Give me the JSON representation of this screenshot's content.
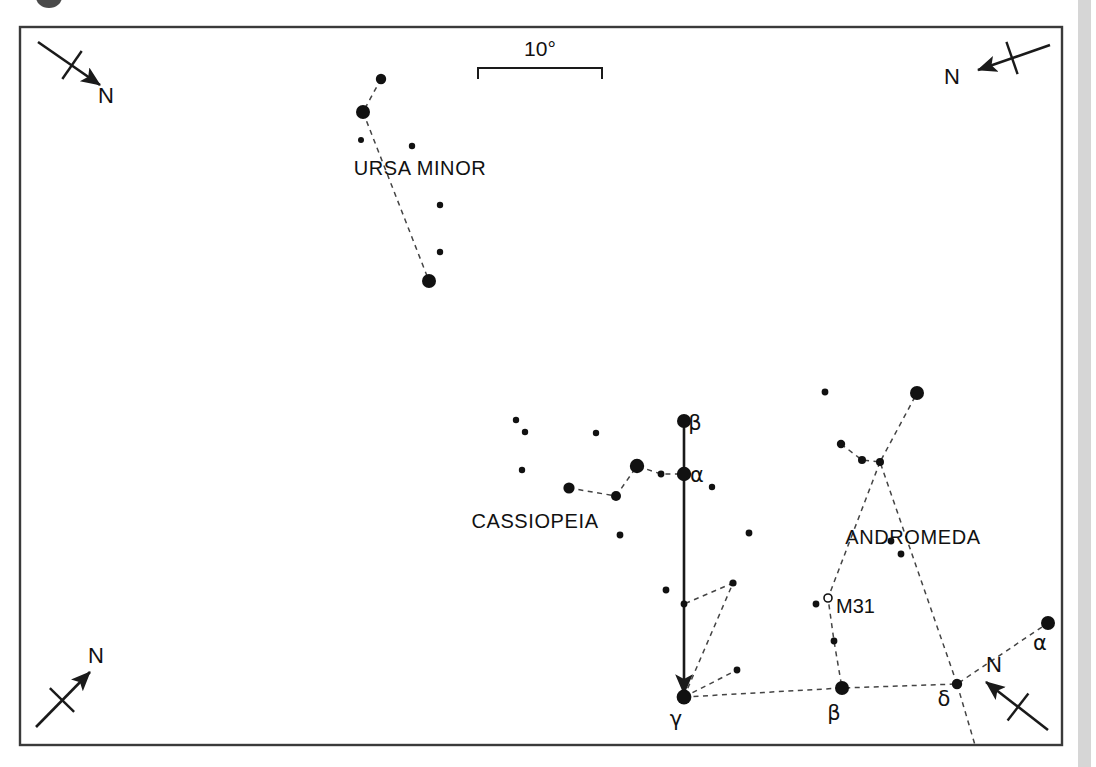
{
  "figure": {
    "kind": "star-chart",
    "frame": {
      "x": 20,
      "y": 27,
      "width": 1042,
      "height": 718
    }
  },
  "scale_bar": {
    "label": "10°",
    "x1": 478,
    "x2": 602,
    "y": 68,
    "tick_height": 11,
    "label_x": 540,
    "label_y": 56
  },
  "north_arrows": [
    {
      "name": "north-arrow-top-left",
      "label": "N",
      "tail_x": 38,
      "tail_y": 42,
      "head_x": 100,
      "head_y": 85,
      "tick_cx": 72,
      "tick_cy": 65,
      "tick_len": 17,
      "label_x": 106,
      "label_y": 103
    },
    {
      "name": "north-arrow-top-right",
      "label": "N",
      "tail_x": 1050,
      "tail_y": 45,
      "head_x": 978,
      "head_y": 70,
      "tick_cx": 1012,
      "tick_cy": 58,
      "tick_len": 17,
      "label_x": 952,
      "label_y": 84
    },
    {
      "name": "north-arrow-bottom-left",
      "label": "N",
      "tail_x": 36,
      "tail_y": 727,
      "head_x": 90,
      "head_y": 672,
      "tick_cx": 62,
      "tick_cy": 700,
      "tick_len": 17,
      "label_x": 96,
      "label_y": 663
    },
    {
      "name": "north-arrow-bottom-right",
      "label": "N",
      "tail_x": 1048,
      "tail_y": 730,
      "head_x": 986,
      "head_y": 682,
      "tick_cx": 1018,
      "tick_cy": 707,
      "tick_len": 17,
      "label_x": 994,
      "label_y": 672
    }
  ],
  "pointer": {
    "name": "pointer-beta-to-gamma",
    "x1": 684,
    "y1": 424,
    "x2": 684,
    "y2": 694
  },
  "constellation_labels": [
    {
      "text": "URSA MINOR",
      "x": 420,
      "y": 175
    },
    {
      "text": "CASSIOPEIA",
      "x": 535,
      "y": 528
    },
    {
      "text": "ANDROMEDA",
      "x": 913,
      "y": 544
    }
  ],
  "object_labels": [
    {
      "text": "M31",
      "x": 836,
      "y": 613
    }
  ],
  "greek_labels": [
    {
      "text": "β",
      "x": 695,
      "y": 430,
      "star": "cassiopeia-beta"
    },
    {
      "text": "α",
      "x": 697,
      "y": 482,
      "star": "cassiopeia-alpha"
    },
    {
      "text": "γ",
      "x": 676,
      "y": 726,
      "star": "andromeda-gamma"
    },
    {
      "text": "β",
      "x": 834,
      "y": 720,
      "star": "andromeda-beta"
    },
    {
      "text": "δ",
      "x": 944,
      "y": 706,
      "star": "andromeda-delta"
    },
    {
      "text": "α",
      "x": 1040,
      "y": 650,
      "star": "andromeda-alpha"
    }
  ],
  "stars": [
    {
      "id": "umi-1",
      "x": 381,
      "y": 79,
      "r": 5.2
    },
    {
      "id": "umi-2",
      "x": 363,
      "y": 112,
      "r": 7.0
    },
    {
      "id": "umi-3",
      "x": 361,
      "y": 140,
      "r": 3.0
    },
    {
      "id": "umi-4",
      "x": 412,
      "y": 146,
      "r": 3.2
    },
    {
      "id": "umi-5",
      "x": 440,
      "y": 205,
      "r": 3.2
    },
    {
      "id": "umi-6",
      "x": 440,
      "y": 252,
      "r": 3.2
    },
    {
      "id": "umi-7",
      "x": 429,
      "y": 281,
      "r": 7.0
    },
    {
      "id": "cas-f1",
      "x": 516,
      "y": 420,
      "r": 3.2
    },
    {
      "id": "cas-f2",
      "x": 525,
      "y": 432,
      "r": 3.2
    },
    {
      "id": "cas-f3",
      "x": 522,
      "y": 470,
      "r": 3.2
    },
    {
      "id": "cas-f4",
      "x": 596,
      "y": 433,
      "r": 3.2
    },
    {
      "id": "cas-e",
      "x": 569,
      "y": 488,
      "r": 5.6
    },
    {
      "id": "cas-d",
      "x": 616,
      "y": 496,
      "r": 5.0
    },
    {
      "id": "cas-g",
      "x": 637,
      "y": 466,
      "r": 7.2
    },
    {
      "id": "cas-mid",
      "x": 661,
      "y": 474,
      "r": 3.4
    },
    {
      "id": "cas-alpha",
      "x": 684,
      "y": 474,
      "r": 7.2
    },
    {
      "id": "cas-beta",
      "x": 684,
      "y": 421,
      "r": 7.0
    },
    {
      "id": "cas-f5",
      "x": 712,
      "y": 487,
      "r": 3.2
    },
    {
      "id": "cas-f6",
      "x": 620,
      "y": 535,
      "r": 3.4
    },
    {
      "id": "cas-f7",
      "x": 749,
      "y": 533,
      "r": 3.4
    },
    {
      "id": "cas-f8",
      "x": 666,
      "y": 590,
      "r": 3.4
    },
    {
      "id": "and-l1",
      "x": 684,
      "y": 604,
      "r": 3.4
    },
    {
      "id": "and-l2",
      "x": 733,
      "y": 583,
      "r": 3.6
    },
    {
      "id": "and-l3",
      "x": 737,
      "y": 670,
      "r": 3.4
    },
    {
      "id": "and-gamma",
      "x": 684,
      "y": 697,
      "r": 7.4
    },
    {
      "id": "and-beta",
      "x": 842,
      "y": 688,
      "r": 7.0
    },
    {
      "id": "and-delta",
      "x": 957,
      "y": 684,
      "r": 5.2
    },
    {
      "id": "and-alpha",
      "x": 1048,
      "y": 623,
      "r": 7.0
    },
    {
      "id": "and-m1",
      "x": 834,
      "y": 641,
      "r": 3.4
    },
    {
      "id": "and-m2",
      "x": 816,
      "y": 604,
      "r": 3.4
    },
    {
      "id": "and-j",
      "x": 880,
      "y": 462,
      "r": 4.0
    },
    {
      "id": "and-k",
      "x": 862,
      "y": 460,
      "r": 4.0
    },
    {
      "id": "and-h",
      "x": 841,
      "y": 444,
      "r": 4.2
    },
    {
      "id": "and-big",
      "x": 917,
      "y": 393,
      "r": 7.0
    },
    {
      "id": "and-f1",
      "x": 825,
      "y": 392,
      "r": 3.4
    },
    {
      "id": "and-f2",
      "x": 891,
      "y": 541,
      "r": 3.4
    },
    {
      "id": "and-f3",
      "x": 901,
      "y": 554,
      "r": 3.4
    }
  ],
  "open_markers": [
    {
      "id": "m31-marker",
      "x": 828,
      "y": 598,
      "r": 4.0
    }
  ],
  "constellation_lines": [
    {
      "id": "umi-line",
      "points": "381,79 363,112 429,281"
    },
    {
      "id": "cas-line",
      "points": "569,488 616,496 637,466 661,474 684,474"
    },
    {
      "id": "and-spine",
      "points": "684,697 842,688 957,684 1048,623"
    },
    {
      "id": "and-upper",
      "points": "957,684 880,462 917,393"
    },
    {
      "id": "and-branch",
      "points": "841,444 862,460 880,462"
    },
    {
      "id": "and-m31-leg",
      "points": "880,462 828,598 834,641 842,688"
    },
    {
      "id": "and-gam-leg1",
      "points": "684,697 733,583 684,604"
    },
    {
      "id": "and-gam-leg2",
      "points": "684,697 737,670"
    },
    {
      "id": "and-delta-tail",
      "points": "957,684 975,745"
    }
  ],
  "colors": {
    "star": "#111111",
    "line": "#444444",
    "frame": "#3a3a3a",
    "pointer": "#1a1a1a",
    "sidebar": "#d6d6d6",
    "background": "#ffffff"
  },
  "chart_data": {
    "type": "scatter",
    "title": "",
    "xlabel": "",
    "ylabel": "",
    "note": "Naked-eye star chart showing Ursa Minor, Cassiopeia and Andromeda with a pointer line from Cassiopeia beta through alpha to Andromeda gamma; M31 marked as an open circle.",
    "scale": "10°",
    "constellations": [
      "URSA MINOR",
      "CASSIOPEIA",
      "ANDROMEDA"
    ],
    "labeled_objects": [
      "M31"
    ],
    "greek_star_labels": [
      "β",
      "α",
      "γ",
      "β",
      "δ",
      "α"
    ],
    "orientation_markers": [
      "N",
      "N",
      "N",
      "N"
    ]
  }
}
